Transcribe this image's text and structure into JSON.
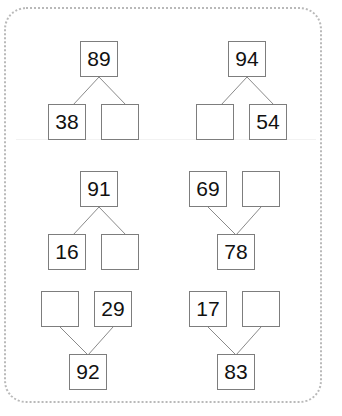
{
  "worksheet": {
    "border_color": "#b9b9b9",
    "box_border_color": "#7d7d7d",
    "line_color": "#8a8a8a",
    "text_color": "#111111",
    "background": "#ffffff"
  },
  "puzzles": [
    {
      "id": "puzzle-1",
      "orientation": "down",
      "parent": "89",
      "left_child": "38",
      "right_child": "",
      "nodes": [
        {
          "name": "parent",
          "value": "89",
          "filled": true
        },
        {
          "name": "left-child",
          "value": "38",
          "filled": true
        },
        {
          "name": "right-child",
          "value": "",
          "filled": false
        }
      ]
    },
    {
      "id": "puzzle-2",
      "orientation": "down",
      "parent": "94",
      "left_child": "",
      "right_child": "54",
      "nodes": [
        {
          "name": "parent",
          "value": "94",
          "filled": true
        },
        {
          "name": "left-child",
          "value": "",
          "filled": false
        },
        {
          "name": "right-child",
          "value": "54",
          "filled": true
        }
      ]
    },
    {
      "id": "puzzle-3",
      "orientation": "down",
      "parent": "91",
      "left_child": "16",
      "right_child": "",
      "nodes": [
        {
          "name": "parent",
          "value": "91",
          "filled": true
        },
        {
          "name": "left-child",
          "value": "16",
          "filled": true
        },
        {
          "name": "right-child",
          "value": "",
          "filled": false
        }
      ]
    },
    {
      "id": "puzzle-4",
      "orientation": "up",
      "parent": "78",
      "left_child": "69",
      "right_child": "",
      "nodes": [
        {
          "name": "left-child",
          "value": "69",
          "filled": true
        },
        {
          "name": "right-child",
          "value": "",
          "filled": false
        },
        {
          "name": "parent",
          "value": "78",
          "filled": true
        }
      ]
    },
    {
      "id": "puzzle-5",
      "orientation": "up",
      "parent": "92",
      "left_child": "",
      "right_child": "29",
      "nodes": [
        {
          "name": "left-child",
          "value": "",
          "filled": false
        },
        {
          "name": "right-child",
          "value": "29",
          "filled": true
        },
        {
          "name": "parent",
          "value": "92",
          "filled": true
        }
      ]
    },
    {
      "id": "puzzle-6",
      "orientation": "up",
      "parent": "83",
      "left_child": "17",
      "right_child": "",
      "nodes": [
        {
          "name": "left-child",
          "value": "17",
          "filled": true
        },
        {
          "name": "right-child",
          "value": "",
          "filled": false
        },
        {
          "name": "parent",
          "value": "83",
          "filled": true
        }
      ]
    }
  ]
}
